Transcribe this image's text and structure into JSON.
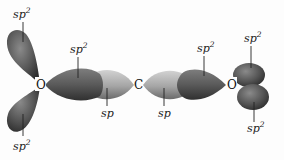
{
  "figure": {
    "atoms": [
      {
        "id": "oxygen-left",
        "symbol": "O"
      },
      {
        "id": "carbon",
        "symbol": "C"
      },
      {
        "id": "oxygen-right",
        "symbol": "O"
      }
    ],
    "labels": {
      "left_top": {
        "base": "sp",
        "sup": "2"
      },
      "left_bottom": {
        "base": "sp",
        "sup": "2"
      },
      "left_bond": {
        "base": "sp",
        "sup": "2"
      },
      "carbon_left": {
        "base": "sp",
        "sup": ""
      },
      "carbon_right": {
        "base": "sp",
        "sup": ""
      },
      "right_bond": {
        "base": "sp",
        "sup": "2"
      },
      "right_top": {
        "base": "sp",
        "sup": "2"
      },
      "right_bottom": {
        "base": "sp",
        "sup": "2"
      }
    },
    "colors": {
      "sp2_lobe_dark": "#3c3c3c",
      "sp2_lobe_mid": "#7a7a7a",
      "sp_lobe_light": "#b8b8b8",
      "sp_lobe_mid": "#8e8e8e"
    }
  }
}
